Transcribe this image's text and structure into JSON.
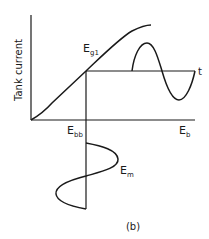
{
  "figure": {
    "caption": "(b)",
    "y_axis_label": "Tank current",
    "x_axis_label": {
      "main": "E",
      "sub": "b"
    },
    "bias_label": {
      "main": "E",
      "sub": "bb"
    },
    "curve_label": {
      "main": "E",
      "sub": "g1"
    },
    "time_label": "t",
    "input_label": {
      "main": "E",
      "sub": "m"
    }
  },
  "colors": {
    "ink": "#1a1a1a",
    "background": "#ffffff"
  }
}
